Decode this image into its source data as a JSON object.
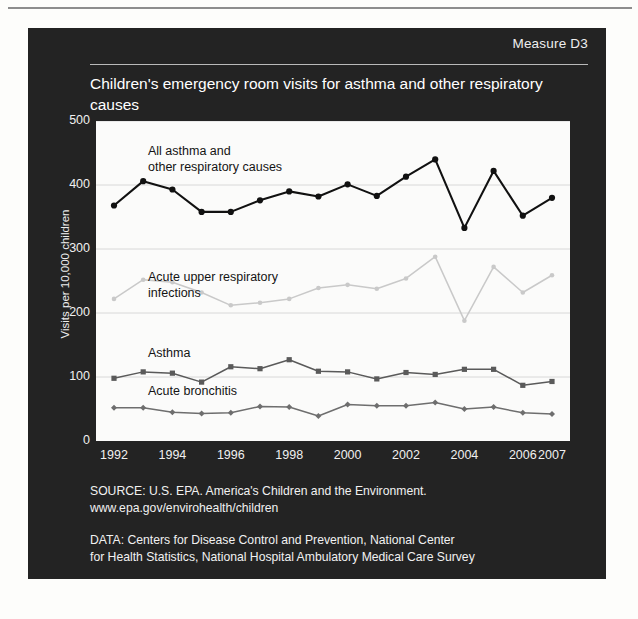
{
  "header": {
    "measure_label": "Measure D3"
  },
  "chart_title": "Children's emergency room visits for asthma and other respiratory causes",
  "footer": {
    "source_line1": "SOURCE: U.S. EPA. America's Children and the Environment.",
    "source_line2": "www.epa.gov/envirohealth/children",
    "data_line1": "DATA: Centers for Disease Control and Prevention, National Center",
    "data_line2": "for Health Statistics, National Hospital Ambulatory Medical Care Survey"
  },
  "colors": {
    "panel_background": "#232323",
    "plot_background": "#fbfbfa",
    "series_all_causes": "#111111",
    "series_acute_upper": "#c9c9c9",
    "series_asthma": "#5a5a5a",
    "series_bronchitis": "#6e6e6e",
    "gridline": "#d8d8d8",
    "text_light": "#f1f1f1"
  },
  "chart_data": {
    "type": "line",
    "title": "Children's emergency room visits for asthma and other respiratory causes",
    "xlabel": "",
    "ylabel": "Visits per 10,000 children",
    "ylim": [
      0,
      500
    ],
    "yticks": [
      0,
      100,
      200,
      300,
      400,
      500
    ],
    "ytick_labels": [
      "0",
      "100",
      "200",
      "300",
      "400",
      "500"
    ],
    "xlim": [
      1992,
      2007
    ],
    "xticks": [
      1992,
      1994,
      1996,
      1998,
      2000,
      2002,
      2004,
      2006,
      2007
    ],
    "xtick_labels": [
      "1992",
      "1994",
      "1996",
      "1998",
      "2000",
      "2002",
      "2004",
      "2006",
      "2007"
    ],
    "x": [
      1992,
      1993,
      1994,
      1995,
      1996,
      1997,
      1998,
      1999,
      2000,
      2001,
      2002,
      2003,
      2004,
      2005,
      2006,
      2007
    ],
    "grid": true,
    "legend": "inline-annotations",
    "series": [
      {
        "name": "All asthma and other respiratory causes",
        "color": "#111111",
        "marker": "circle",
        "label_lines": [
          "All asthma and",
          "other respiratory causes"
        ],
        "values": [
          368,
          406,
          393,
          358,
          358,
          376,
          390,
          382,
          401,
          383,
          413,
          440,
          333,
          422,
          352,
          380
        ]
      },
      {
        "name": "Acute upper respiratory infections",
        "color": "#c9c9c9",
        "marker": "circle",
        "label_lines": [
          "Acute upper respiratory",
          "infections"
        ],
        "values": [
          222,
          252,
          248,
          232,
          212,
          216,
          222,
          239,
          244,
          238,
          254,
          288,
          188,
          272,
          232,
          259
        ]
      },
      {
        "name": "Asthma",
        "color": "#5a5a5a",
        "marker": "square",
        "label_lines": [
          "Asthma"
        ],
        "values": [
          98,
          108,
          106,
          92,
          116,
          113,
          127,
          109,
          108,
          97,
          107,
          104,
          112,
          112,
          87,
          93
        ]
      },
      {
        "name": "Acute bronchitis",
        "color": "#6e6e6e",
        "marker": "diamond",
        "label_lines": [
          "Acute bronchitis"
        ],
        "values": [
          52,
          52,
          45,
          43,
          44,
          54,
          53,
          39,
          57,
          55,
          55,
          60,
          50,
          53,
          44,
          42
        ]
      }
    ],
    "annotations": [
      {
        "text": "All asthma and\nother respiratory causes",
        "x_px": 52,
        "y_px": 22
      },
      {
        "text": "Acute upper respiratory\ninfections",
        "x_px": 52,
        "y_px": 148
      },
      {
        "text": "Asthma",
        "x_px": 52,
        "y_px": 224
      },
      {
        "text": "Acute bronchitis",
        "x_px": 52,
        "y_px": 262
      }
    ]
  }
}
